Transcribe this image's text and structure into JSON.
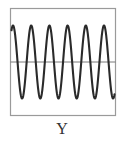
{
  "figure": {
    "label": "Y",
    "colors": {
      "background": "#ffffff",
      "frame": "#9a9a9a",
      "midline": "#7a7a7a",
      "wave": "#2a2a2a"
    }
  },
  "chart_data": {
    "type": "line",
    "title": "",
    "xlabel": "Y",
    "ylabel": "",
    "grid": false,
    "legend": null,
    "frame": {
      "x": 10,
      "y": 8,
      "width": 106,
      "height": 108
    },
    "midline_y": 62,
    "amplitude_px": 36.5,
    "period_px": 18.2,
    "first_peak_x": 13,
    "cycles_visible": 5.8,
    "peaks_x": [
      13,
      31.2,
      49.4,
      67.6,
      85.8,
      104,
      112
    ],
    "troughs_x": [
      22.1,
      40.3,
      58.5,
      76.7,
      94.9,
      103.1
    ]
  }
}
